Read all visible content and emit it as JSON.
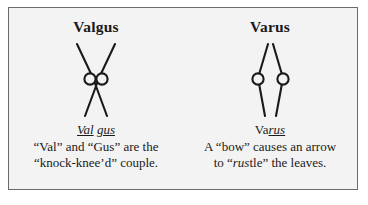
{
  "figure": {
    "border_color": "#6b6b6b",
    "background_color": "#f3f3f3",
    "ink_color": "#1a1a1a",
    "panels": [
      {
        "heading": "Valgus",
        "diagram_name": "valgus-knock-knee-diagram",
        "mnemonic": {
          "part1": "Val",
          "space": " ",
          "part2": "gus"
        },
        "caption_line1": "“Val” and “Gus” are the",
        "caption_line2": "“knock-knee’d” couple."
      },
      {
        "heading": "Varus",
        "diagram_name": "varus-bow-leg-diagram",
        "mnemonic": {
          "part1": "Va",
          "space": "",
          "part2": "rus"
        },
        "caption_line1": "A “bow” causes an arrow",
        "caption_line2_pre": "to “",
        "caption_line2_italic": "rus",
        "caption_line2_post": "tle” the leaves."
      }
    ]
  }
}
